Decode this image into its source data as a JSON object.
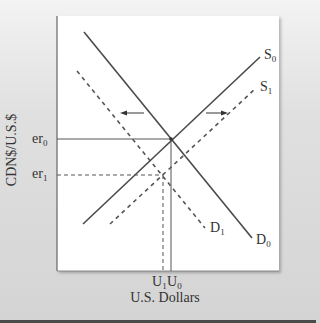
{
  "diagram": {
    "type": "supply-demand",
    "y_axis_label": "CDN$/U.S.$",
    "x_axis_label": "U.S. Dollars",
    "y_ticks": [
      {
        "main": "er",
        "sub": "0"
      },
      {
        "main": "er",
        "sub": "1"
      }
    ],
    "x_ticks": [
      {
        "main": "U",
        "sub": "1"
      },
      {
        "main": "U",
        "sub": "0"
      }
    ],
    "curves": [
      {
        "id": "S0",
        "main": "S",
        "sub": "0",
        "style": "solid",
        "role": "original supply"
      },
      {
        "id": "S1",
        "main": "S",
        "sub": "1",
        "style": "dashed",
        "role": "shifted supply (right)"
      },
      {
        "id": "D0",
        "main": "D",
        "sub": "0",
        "style": "solid",
        "role": "original demand"
      },
      {
        "id": "D1",
        "main": "D",
        "sub": "1",
        "style": "dashed",
        "role": "shifted demand (left)"
      }
    ],
    "arrows": [
      {
        "id": "demand-shift-arrow",
        "direction": "left"
      },
      {
        "id": "supply-shift-arrow",
        "direction": "right"
      }
    ],
    "equilibria": [
      {
        "id": "E0",
        "rate": "er0",
        "quantity": "U0",
        "guide_style": "solid"
      },
      {
        "id": "E1",
        "rate": "er1",
        "quantity": "U1",
        "guide_style": "dashed"
      }
    ],
    "colors": {
      "line": "#4a4a4a",
      "panel": "#ffffff",
      "axis": "#555555"
    }
  }
}
